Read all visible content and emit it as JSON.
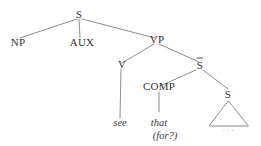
{
  "figure": {
    "kind": "syntax-tree-diagram",
    "background_color": "#ffffff",
    "line_color": "#808080",
    "text_color": "#333333"
  },
  "nodes": {
    "root_s": "S",
    "np": "NP",
    "aux": "AUX",
    "vp": "VP",
    "v": "V",
    "s_bar": "S",
    "comp": "COMP",
    "embedded_s": "S"
  },
  "leaves": {
    "see": "see",
    "that": "that",
    "for_q": "(for?)",
    "ellipsis": "..."
  }
}
